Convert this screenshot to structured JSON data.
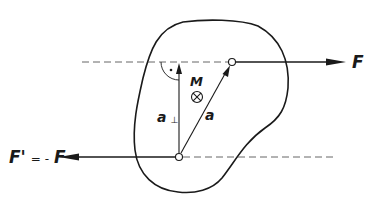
{
  "figure": {
    "background_color": "#ffffff",
    "line_color": "#1a1a1a",
    "dash_color": "#555555"
  },
  "labels": {
    "force_top": "F",
    "force_bottom_prefix": "F'",
    "force_bottom_eq": "= -",
    "force_bottom_suffix": "F",
    "moment": "M",
    "moment_symbol": "⊗",
    "perp_distance": "a",
    "perp_distance_sub": "⊥",
    "distance": "a",
    "right_angle_dot": "·"
  },
  "geometry": {
    "top_point": {
      "x": 232,
      "y": 62
    },
    "bottom_point": {
      "x": 179,
      "y": 157
    },
    "top_line_of_action_y": 62,
    "bottom_line_of_action_y": 157,
    "top_arrow_tip_x": 345,
    "bottom_arrow_tip_x": 60
  }
}
